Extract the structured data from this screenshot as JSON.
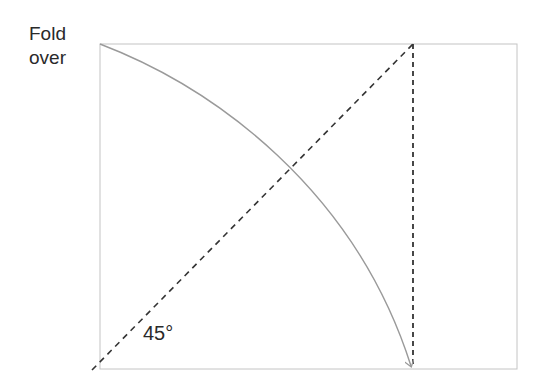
{
  "labels": {
    "fold_line1": "Fold",
    "fold_line2": "over",
    "angle": "45°"
  },
  "colors": {
    "rect_stroke": "#b8b8b8",
    "dashed": "#333333",
    "arc": "#9a9a9a",
    "text": "#2a2a2a"
  },
  "geometry": {
    "rectangle": {
      "x": 100,
      "y": 44,
      "width": 417,
      "height": 325
    },
    "diagonal_dashed": {
      "x1": 92,
      "y1": 370,
      "x2": 413,
      "y2": 44
    },
    "vertical_dashed": {
      "x1": 413,
      "y1": 44,
      "x2": 413,
      "y2": 368
    },
    "arc_with_arrow": {
      "from": [
        100,
        44
      ],
      "to": [
        411,
        368
      ]
    }
  }
}
